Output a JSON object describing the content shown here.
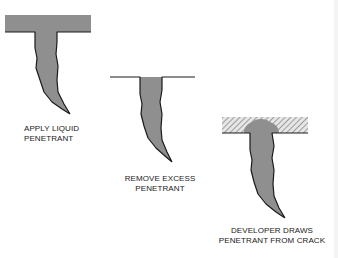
{
  "colors": {
    "penetrant": "#8f8f8f",
    "outline": "#1a1a1a",
    "background": "#ffffff",
    "hatch": "#9a9a9a"
  },
  "steps": [
    {
      "id": "apply",
      "lines": [
        "APPLY LIQUID",
        "PENETRANT"
      ],
      "surface": "penetrant-coated"
    },
    {
      "id": "remove",
      "lines": [
        "REMOVE EXCESS",
        "PENETRANT"
      ],
      "surface": "clean"
    },
    {
      "id": "develop",
      "lines": [
        "DEVELOPER DRAWS",
        "PENETRANT FROM CRACK"
      ],
      "surface": "developer-coated"
    }
  ]
}
